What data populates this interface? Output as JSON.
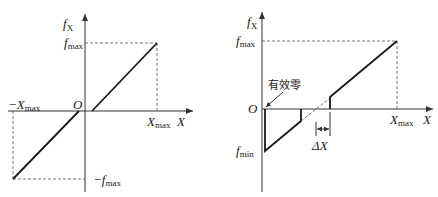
{
  "left_graph": {
    "y_axis_label": "f",
    "y_axis_sub": "X",
    "x_axis_label": "X",
    "origin_label": "O",
    "fmax_label": "f",
    "fmax_sub": "max",
    "neg_fmax_label": "−f",
    "neg_fmax_sub": "max",
    "xmax_label": "X",
    "xmax_sub": "max",
    "neg_xmax_label": "−X",
    "neg_xmax_sub": "max"
  },
  "right_graph": {
    "y_axis_label": "f",
    "y_axis_sub": "X",
    "x_axis_label": "X",
    "origin_label": "O",
    "fmax_label": "f",
    "fmax_sub": "max",
    "fmin_label": "f",
    "fmin_sub": "min",
    "xmax_label": "X",
    "xmax_sub": "max",
    "effective_zero_label": "有效零",
    "delta_x_label": "ΔX"
  }
}
